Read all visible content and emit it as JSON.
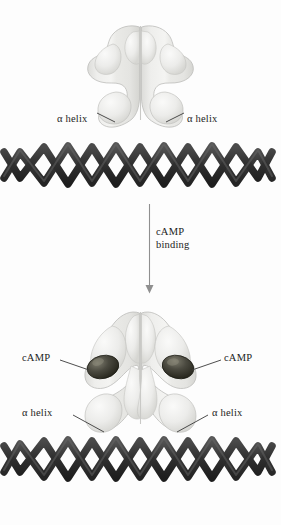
{
  "figure": {
    "background_color": "#fdfdfd",
    "protein_color": "#e8e8e6",
    "protein_outline_color": "#b9b9b6",
    "camp_color": "#3b3a33",
    "helix_ribbon_color": "#3a3a3a",
    "leader_line_color": "#3a3a3a",
    "arrow_color": "#8a8a8a",
    "text_color": "#1c1c1c"
  },
  "top_panel": {
    "alpha_helix_left": "α helix",
    "alpha_helix_right": "α helix"
  },
  "transition": {
    "line1": "cAMP",
    "line2": "binding",
    "arrow_icon": "down-arrow-icon"
  },
  "bottom_panel": {
    "camp_left": "cAMP",
    "camp_right": "cAMP",
    "alpha_helix_left": "α helix",
    "alpha_helix_right": "α helix"
  }
}
